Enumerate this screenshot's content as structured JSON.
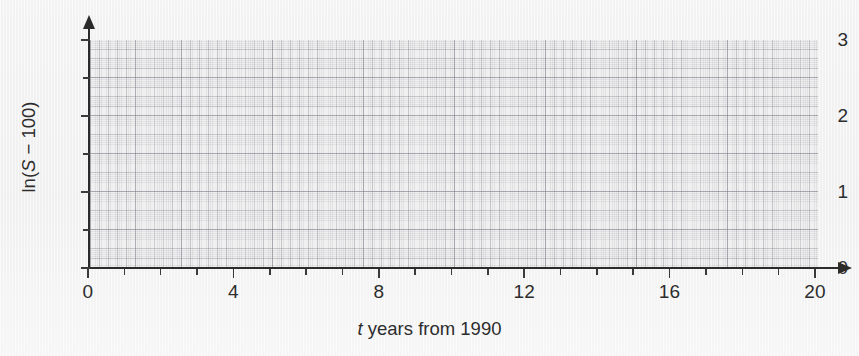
{
  "figure": {
    "background_color": "#f1f1f1",
    "grid_color": "#8a8c96",
    "axis_color": "#2b2b2b",
    "text_color": "#2d2d2d"
  },
  "chart_data": {
    "type": "scatter",
    "title": "",
    "subtitle": "",
    "xlabel_parts": {
      "variable": "t",
      "rest": " years from 1990"
    },
    "xlabel": "t years from 1990",
    "ylabel_parts": {
      "prefix": "ln(",
      "variable": "S",
      "suffix": " − 100)"
    },
    "ylabel": "ln(S − 100)",
    "x": [],
    "y": [],
    "series": [],
    "annotations": [],
    "legend": {
      "entries": [],
      "position": "none"
    },
    "grid": true,
    "grid_style": "graph-paper",
    "xlim": [
      0,
      20
    ],
    "ylim": [
      0,
      3
    ],
    "x_major_step": 4,
    "x_minor_step": 1,
    "y_major_step": 1,
    "y_minor_step": 0.5,
    "x_tick_labels": [
      "0",
      "4",
      "8",
      "12",
      "16",
      "20"
    ],
    "x_tick_values": [
      0,
      4,
      8,
      12,
      16,
      20
    ],
    "x_minor_tick_values": [
      1,
      2,
      3,
      5,
      6,
      7,
      9,
      10,
      11,
      13,
      14,
      15,
      17,
      18,
      19
    ],
    "y_tick_labels": [
      "0",
      "1",
      "2",
      "3"
    ],
    "y_tick_values": [
      0,
      1,
      2,
      3
    ],
    "y_minor_tick_values": [
      0.5,
      1.5,
      2.5
    ],
    "x_axis_arrow": true,
    "y_axis_arrow": true
  }
}
